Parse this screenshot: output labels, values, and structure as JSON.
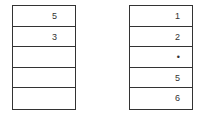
{
  "left_table": {
    "cells": [
      "5",
      "3",
      "",
      "",
      ""
    ]
  },
  "right_table": {
    "cells": [
      "1",
      "2",
      "•",
      "5",
      "6"
    ]
  }
}
